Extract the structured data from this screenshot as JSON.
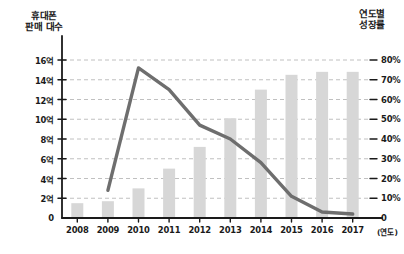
{
  "chart_data": {
    "type": "bar",
    "title": "",
    "subtitle": "",
    "categories": [
      "2008",
      "2009",
      "2010",
      "2011",
      "2012",
      "2013",
      "2014",
      "2015",
      "2016",
      "2017"
    ],
    "xlabel": "(연도)",
    "grid": true,
    "legend_position": "none",
    "series": [
      {
        "name": "휴대폰 판매 대수",
        "type": "bar",
        "axis": "left",
        "unit": "억",
        "values": [
          1.5,
          1.7,
          3.0,
          5.0,
          7.2,
          10.1,
          13.0,
          14.5,
          14.8,
          14.8
        ]
      },
      {
        "name": "연도별 성장률",
        "type": "line",
        "axis": "right",
        "unit": "%",
        "values": [
          null,
          14,
          76,
          65,
          47,
          40,
          28,
          11,
          3,
          2
        ]
      }
    ],
    "left_axis": {
      "label": "휴대폰\n판매 대수",
      "ticks": [
        "0",
        "2억",
        "4억",
        "6억",
        "8억",
        "10억",
        "12억",
        "14억",
        "16억"
      ],
      "tick_values": [
        0,
        2,
        4,
        6,
        8,
        10,
        12,
        14,
        16
      ],
      "ylim": [
        0,
        16
      ]
    },
    "right_axis": {
      "label": "연도별\n성장률",
      "ticks": [
        "0",
        "10%",
        "20%",
        "30%",
        "40%",
        "50%",
        "60%",
        "70%",
        "80%"
      ],
      "tick_values": [
        0,
        10,
        20,
        30,
        40,
        50,
        60,
        70,
        80
      ],
      "ylim": [
        0,
        80
      ]
    },
    "colors": {
      "bar": "#d7d7d7",
      "line": "#6e6e6e",
      "axis": "#1a1a1a",
      "grid": "#b9b9b9",
      "background": "#ffffff"
    }
  }
}
